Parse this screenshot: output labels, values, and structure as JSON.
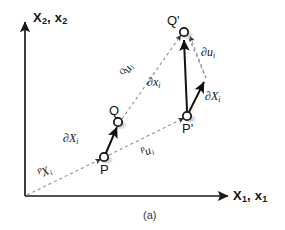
{
  "figure": {
    "caption": "(a)",
    "axes": {
      "y_label_main": "X",
      "y_label_main_sub": "2",
      "y_label_second": "x",
      "y_label_second_sub": "2",
      "y_label_full": "X2, x2",
      "x_label_main": "X",
      "x_label_main_sub": "1",
      "x_label_second": "x",
      "x_label_second_sub": "1",
      "x_label_full": "X1, x1",
      "axis_color": "#1a1a1a"
    },
    "points": [
      {
        "id": "P",
        "label": "P",
        "x": 104,
        "y": 157
      },
      {
        "id": "Q",
        "label": "Q",
        "x": 118,
        "y": 122
      },
      {
        "id": "Pp",
        "label": "P'",
        "x": 187,
        "y": 116
      },
      {
        "id": "Qp",
        "label": "Q'",
        "x": 184,
        "y": 32
      }
    ],
    "vectors": [
      {
        "id": "dXi-left",
        "label": "∂X",
        "sub": "i",
        "from": "P",
        "to": "Q"
      },
      {
        "id": "dxi-mid",
        "label": "∂x",
        "sub": "i",
        "from": "P'",
        "to": "Q'"
      },
      {
        "id": "dXi-right",
        "label": "∂X",
        "sub": "i",
        "from": "P'",
        "to": "R"
      }
    ],
    "dashed_lines": [
      {
        "id": "PXi",
        "presup": "P",
        "label": "X",
        "sub": "i",
        "desc": "position-vector-P"
      },
      {
        "id": "Pui",
        "presup": "P",
        "label": "u",
        "sub": "i",
        "desc": "displacement-P"
      },
      {
        "id": "Qui",
        "presup": "Q",
        "label": "u",
        "sub": "i",
        "desc": "displacement-Q"
      },
      {
        "id": "dui",
        "presup": "",
        "label": "∂u",
        "sub": "i",
        "desc": "displacement-gradient"
      }
    ],
    "labels": {
      "dXi_left": "∂X",
      "dXi_left_sub": "i",
      "dxi_mid": "∂x",
      "dxi_mid_sub": "i",
      "dXi_right": "∂X",
      "dXi_right_sub": "i",
      "dui_right": "∂u",
      "dui_right_sub": "i",
      "Qui_presup": "Q",
      "Qui": "u",
      "Qui_sub": "i",
      "Pui_presup": "P",
      "Pui": "u",
      "Pui_sub": "i",
      "PXi_presup": "P",
      "PXi": "X",
      "PXi_sub": "i"
    },
    "colors": {
      "line": "#1a1a1a",
      "dashed": "#8c8c8c",
      "marker_fill": "#ffffff",
      "marker_stroke": "#111111",
      "shadow": "#c8c8c8",
      "background": "#ffffff"
    }
  }
}
